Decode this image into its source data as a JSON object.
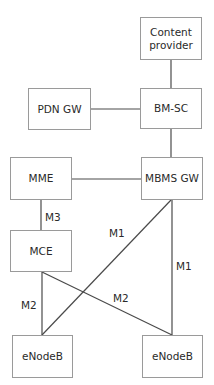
{
  "diagram": {
    "nodes": {
      "content_provider": {
        "label": "Content\nprovider",
        "line1": "Content",
        "line2": "provider"
      },
      "bmsc": {
        "label": "BM-SC"
      },
      "pdn_gw": {
        "label": "PDN GW"
      },
      "mme": {
        "label": "MME"
      },
      "mbms_gw": {
        "label": "MBMS GW"
      },
      "mce": {
        "label": "MCE"
      },
      "enodeb_left": {
        "label": "eNodeB"
      },
      "enodeb_right": {
        "label": "eNodeB"
      }
    },
    "edges": [
      {
        "from": "Content provider",
        "to": "BM-SC",
        "label": ""
      },
      {
        "from": "PDN GW",
        "to": "BM-SC",
        "label": ""
      },
      {
        "from": "BM-SC",
        "to": "MBMS GW",
        "label": ""
      },
      {
        "from": "MME",
        "to": "MBMS GW",
        "label": ""
      },
      {
        "from": "MME",
        "to": "MCE",
        "label": "M3"
      },
      {
        "from": "MBMS GW",
        "to": "eNodeB (left)",
        "label": "M1"
      },
      {
        "from": "MBMS GW",
        "to": "eNodeB (right)",
        "label": "M1"
      },
      {
        "from": "MCE",
        "to": "eNodeB (left)",
        "label": "M2"
      },
      {
        "from": "MCE",
        "to": "eNodeB (right)",
        "label": "M2"
      }
    ],
    "edge_labels": {
      "m3": "M3",
      "m1_diag": "M1",
      "m1_vert": "M1",
      "m2_vert": "M2",
      "m2_diag": "M2"
    },
    "colors": {
      "line": "#4a4a4a",
      "box_border": "#9a9a9a",
      "text": "#2a2a2a"
    }
  }
}
